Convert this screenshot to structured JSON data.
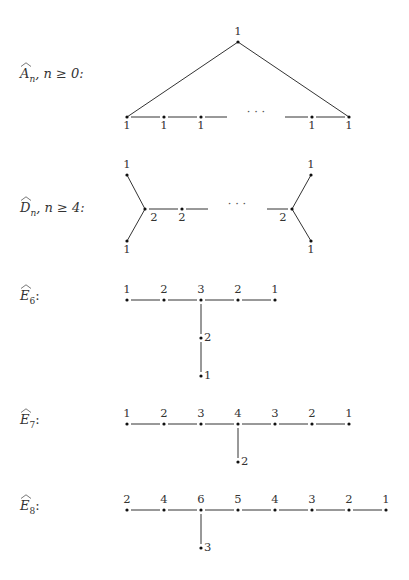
{
  "diagrams": [
    {
      "id": "A",
      "label": {
        "letter": "A",
        "sub": "n",
        "cond": ", n ≥ 0:"
      },
      "nodes": [
        {
          "x": 238,
          "y": 42,
          "w": "1",
          "pos": "above"
        },
        {
          "x": 127,
          "y": 117,
          "w": "1",
          "pos": "below"
        },
        {
          "x": 164,
          "y": 117,
          "w": "1",
          "pos": "below"
        },
        {
          "x": 201,
          "y": 117,
          "w": "1",
          "pos": "below"
        },
        {
          "x": 312,
          "y": 117,
          "w": "1",
          "pos": "below"
        },
        {
          "x": 349,
          "y": 117,
          "w": "1",
          "pos": "below"
        }
      ],
      "edges": [
        [
          238,
          42,
          127,
          117
        ],
        [
          238,
          42,
          349,
          117
        ],
        [
          131,
          117,
          160,
          117
        ],
        [
          168,
          117,
          197,
          117
        ],
        [
          205,
          117,
          227,
          117
        ],
        [
          285,
          117,
          308,
          117
        ],
        [
          316,
          117,
          345,
          117
        ]
      ],
      "ellipsis": {
        "x": 256,
        "y": 112,
        "text": "· · ·"
      }
    },
    {
      "id": "D",
      "label": {
        "letter": "D",
        "sub": "n",
        "cond": ", n ≥ 4:"
      },
      "nodes": [
        {
          "x": 127,
          "y": 175,
          "w": "1",
          "pos": "above"
        },
        {
          "x": 127,
          "y": 241,
          "w": "1",
          "pos": "below"
        },
        {
          "x": 145,
          "y": 209,
          "w": "2",
          "pos": "below-right"
        },
        {
          "x": 182,
          "y": 209,
          "w": "2",
          "pos": "below"
        },
        {
          "x": 292,
          "y": 209,
          "w": "2",
          "pos": "below-left"
        },
        {
          "x": 311,
          "y": 175,
          "w": "1",
          "pos": "above"
        },
        {
          "x": 311,
          "y": 241,
          "w": "1",
          "pos": "below"
        }
      ],
      "edges": [
        [
          127,
          175,
          145,
          209
        ],
        [
          127,
          241,
          145,
          209
        ],
        [
          149,
          209,
          178,
          209
        ],
        [
          186,
          209,
          208,
          209
        ],
        [
          267,
          209,
          288,
          209
        ],
        [
          311,
          175,
          292,
          209
        ],
        [
          311,
          241,
          292,
          209
        ]
      ],
      "ellipsis": {
        "x": 237,
        "y": 204,
        "text": "· · ·"
      }
    },
    {
      "id": "E6",
      "label": {
        "letter": "E",
        "sub": "6",
        "cond": ":"
      },
      "nodes": [
        {
          "x": 127,
          "y": 300,
          "w": "1",
          "pos": "above"
        },
        {
          "x": 164,
          "y": 300,
          "w": "2",
          "pos": "above"
        },
        {
          "x": 201,
          "y": 300,
          "w": "3",
          "pos": "above"
        },
        {
          "x": 238,
          "y": 300,
          "w": "2",
          "pos": "above"
        },
        {
          "x": 275,
          "y": 300,
          "w": "1",
          "pos": "above"
        },
        {
          "x": 201,
          "y": 338,
          "w": "2",
          "pos": "right"
        },
        {
          "x": 201,
          "y": 376,
          "w": "1",
          "pos": "right"
        }
      ],
      "edges": [
        [
          131,
          300,
          160,
          300
        ],
        [
          168,
          300,
          197,
          300
        ],
        [
          205,
          300,
          234,
          300
        ],
        [
          242,
          300,
          271,
          300
        ],
        [
          201,
          304,
          201,
          334
        ],
        [
          201,
          342,
          201,
          372
        ]
      ]
    },
    {
      "id": "E7",
      "label": {
        "letter": "E",
        "sub": "7",
        "cond": ":"
      },
      "nodes": [
        {
          "x": 127,
          "y": 424,
          "w": "1",
          "pos": "above"
        },
        {
          "x": 164,
          "y": 424,
          "w": "2",
          "pos": "above"
        },
        {
          "x": 201,
          "y": 424,
          "w": "3",
          "pos": "above"
        },
        {
          "x": 238,
          "y": 424,
          "w": "4",
          "pos": "above"
        },
        {
          "x": 275,
          "y": 424,
          "w": "3",
          "pos": "above"
        },
        {
          "x": 312,
          "y": 424,
          "w": "2",
          "pos": "above"
        },
        {
          "x": 349,
          "y": 424,
          "w": "1",
          "pos": "above"
        },
        {
          "x": 238,
          "y": 462,
          "w": "2",
          "pos": "right"
        }
      ],
      "edges": [
        [
          131,
          424,
          160,
          424
        ],
        [
          168,
          424,
          197,
          424
        ],
        [
          205,
          424,
          234,
          424
        ],
        [
          242,
          424,
          271,
          424
        ],
        [
          279,
          424,
          308,
          424
        ],
        [
          316,
          424,
          345,
          424
        ],
        [
          238,
          428,
          238,
          458
        ]
      ]
    },
    {
      "id": "E8",
      "label": {
        "letter": "E",
        "sub": "8",
        "cond": ":"
      },
      "nodes": [
        {
          "x": 127,
          "y": 510,
          "w": "2",
          "pos": "above"
        },
        {
          "x": 164,
          "y": 510,
          "w": "4",
          "pos": "above"
        },
        {
          "x": 201,
          "y": 510,
          "w": "6",
          "pos": "above"
        },
        {
          "x": 238,
          "y": 510,
          "w": "5",
          "pos": "above"
        },
        {
          "x": 275,
          "y": 510,
          "w": "4",
          "pos": "above"
        },
        {
          "x": 312,
          "y": 510,
          "w": "3",
          "pos": "above"
        },
        {
          "x": 349,
          "y": 510,
          "w": "2",
          "pos": "above"
        },
        {
          "x": 386,
          "y": 510,
          "w": "1",
          "pos": "above"
        },
        {
          "x": 201,
          "y": 548,
          "w": "3",
          "pos": "right"
        }
      ],
      "edges": [
        [
          131,
          510,
          160,
          510
        ],
        [
          168,
          510,
          197,
          510
        ],
        [
          205,
          510,
          234,
          510
        ],
        [
          242,
          510,
          271,
          510
        ],
        [
          279,
          510,
          308,
          510
        ],
        [
          316,
          510,
          345,
          510
        ],
        [
          353,
          510,
          382,
          510
        ],
        [
          201,
          514,
          201,
          544
        ]
      ]
    }
  ],
  "labels": [
    {
      "id": "A",
      "x": 20,
      "y": 66
    },
    {
      "id": "D",
      "x": 20,
      "y": 200
    },
    {
      "id": "E6",
      "x": 20,
      "y": 288
    },
    {
      "id": "E7",
      "x": 20,
      "y": 412
    },
    {
      "id": "E8",
      "x": 20,
      "y": 498
    }
  ]
}
